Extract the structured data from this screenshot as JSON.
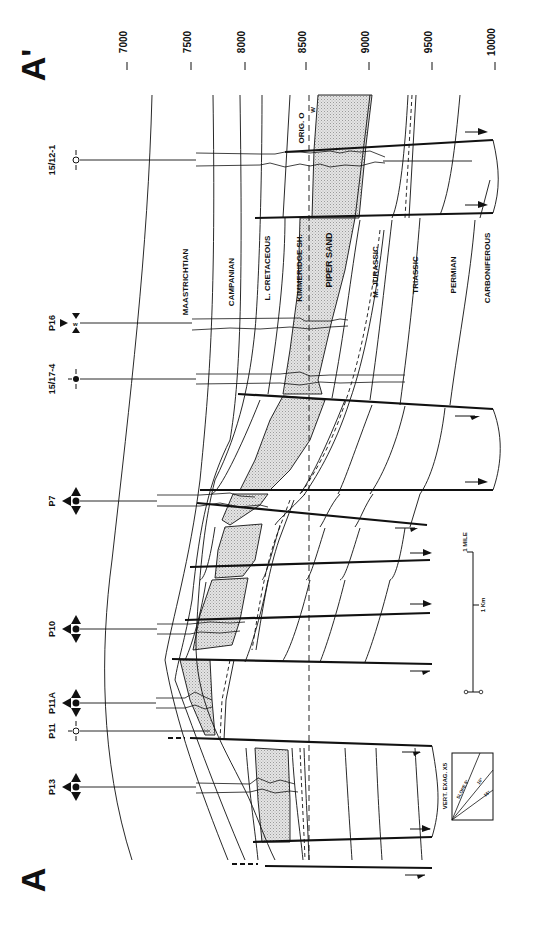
{
  "section": {
    "start_label": "A",
    "end_label": "A'",
    "orientation": "rotated 90° clockwise; depth increases left-to-right across page"
  },
  "depth_scale": {
    "unit": "ft",
    "ticks": [
      {
        "label": "7000",
        "x": 127
      },
      {
        "label": "7500",
        "x": 191
      },
      {
        "label": "8000",
        "x": 245
      },
      {
        "label": "8500",
        "x": 306
      },
      {
        "label": "9000",
        "x": 369
      },
      {
        "label": "9500",
        "x": 432
      },
      {
        "label": "10000",
        "x": 495
      }
    ]
  },
  "wells": [
    {
      "name": "15/12-1",
      "symbol": "dry-hole-open-circle",
      "y": 160
    },
    {
      "name": "P16",
      "symbol": "water-injector",
      "y": 323
    },
    {
      "name": "15/17-4",
      "symbol": "oil-well-filled-circle",
      "y": 379
    },
    {
      "name": "P7",
      "symbol": "producer-arrows",
      "y": 501
    },
    {
      "name": "P10",
      "symbol": "producer-arrows",
      "y": 629
    },
    {
      "name": "P11A",
      "symbol": "producer-arrows",
      "y": 703
    },
    {
      "name": "P11",
      "symbol": "dry-hole-open-circle",
      "y": 731
    },
    {
      "name": "P13",
      "symbol": "producer-arrows",
      "y": 787
    }
  ],
  "formations": [
    {
      "name": "MAASTRICHTIAN",
      "x": 188
    },
    {
      "name": "CAMPANIAN",
      "x": 234
    },
    {
      "name": "L. CRETACEOUS",
      "x": 270
    },
    {
      "name": "KIMMERIDGE SH.",
      "x": 302
    },
    {
      "name": "PIPER SAND",
      "x": 332
    },
    {
      "name": "M. JURASSIC",
      "x": 378
    },
    {
      "name": "TRIASSIC",
      "x": 418
    },
    {
      "name": "PERMIAN",
      "x": 456
    },
    {
      "name": "CARBONIFEROUS",
      "x": 490
    }
  ],
  "contacts": {
    "original_oil_water_label": "ORIG. O",
    "original_oil_water_sublabel": "W"
  },
  "scale_bar": {
    "mile_label": "1 MILE",
    "km_label": "1 Km",
    "zero_label": "0"
  },
  "vertical_exaggeration": {
    "title": "VERT. EXAG. X5",
    "slopes": [
      "SLOPE 5°",
      "10°",
      "15°"
    ]
  },
  "colors": {
    "ink": "#111111",
    "paper": "#ffffff",
    "sand_fill": "#d6d6d6"
  }
}
